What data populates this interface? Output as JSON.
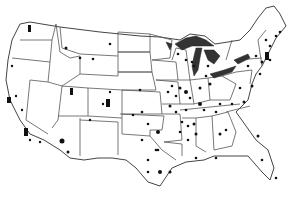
{
  "caption": {
    "text": "gap figure caption cropped at top edge (only descenders visible)"
  },
  "map": {
    "region": "Contiguous United States",
    "style": "grayscale",
    "colors": {
      "background": "#ffffff",
      "borders": "#555555",
      "lakes": "#333333",
      "markers": "#111111"
    },
    "features": [
      "state boundaries",
      "Great Lakes shaded dark",
      "site markers (dots and triangles)"
    ],
    "marker_clusters": [
      {
        "area": "Northwest (WA)",
        "count": 2
      },
      {
        "area": "California coast",
        "count": 8
      },
      {
        "area": "Utah / Colorado",
        "count": 6
      },
      {
        "area": "Midwest (IA/IL/MO)",
        "count": 20
      },
      {
        "area": "Great Lakes region",
        "count": 12
      },
      {
        "area": "Northeast corridor",
        "count": 15
      },
      {
        "area": "Southeast",
        "count": 10
      },
      {
        "area": "Texas / Oklahoma",
        "count": 12
      }
    ]
  }
}
